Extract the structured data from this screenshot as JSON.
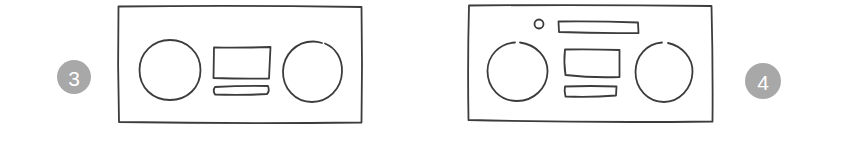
{
  "figure": {
    "colors": {
      "line": "#3c3c3c",
      "badge_fill": "#a8a8a8",
      "badge_text": "#ffffff",
      "background": "#ffffff"
    },
    "panels": [
      {
        "step_label": "3",
        "badge_position": "left",
        "elements": [
          "outer-frame",
          "left-speaker-circle",
          "center-display-rect",
          "cassette-slot-bar",
          "right-speaker-circle"
        ]
      },
      {
        "step_label": "4",
        "badge_position": "right",
        "elements": [
          "outer-frame",
          "small-knob-circle",
          "top-handle-bar",
          "left-speaker-circle",
          "center-display-rect",
          "cassette-slot-bar",
          "right-speaker-circle"
        ]
      }
    ]
  }
}
